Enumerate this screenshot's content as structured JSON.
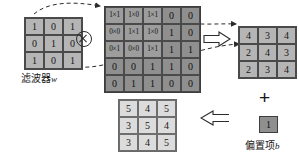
{
  "diagram": {
    "filter": {
      "label": "滤波器",
      "label_var": "w",
      "rows": [
        [
          "1",
          "0",
          "1"
        ],
        [
          "0",
          "1",
          "0"
        ],
        [
          "1",
          "0",
          "1"
        ]
      ]
    },
    "input": {
      "rows": [
        [
          "1×1",
          "1×0",
          "1×1",
          "0",
          "0"
        ],
        [
          "0×0",
          "1×1",
          "1×0",
          "1",
          "0"
        ],
        [
          "0×1",
          "0×0",
          "1×1",
          "1",
          "1"
        ],
        [
          "0",
          "0",
          "1",
          "1",
          "0"
        ],
        [
          "0",
          "1",
          "1",
          "0",
          "0"
        ]
      ],
      "overlay_cols": 3,
      "overlay_rows": 3
    },
    "result": {
      "rows": [
        [
          "4",
          "3",
          "4"
        ],
        [
          "2",
          "4",
          "3"
        ],
        [
          "2",
          "3",
          "4"
        ]
      ]
    },
    "bias": {
      "value": "1",
      "label": "偏置项",
      "label_var": "b"
    },
    "output": {
      "rows": [
        [
          "5",
          "4",
          "5"
        ],
        [
          "3",
          "5",
          "4"
        ],
        [
          "3",
          "4",
          "5"
        ]
      ]
    },
    "operators": {
      "convolution": "⊗",
      "plus": "+",
      "implies_right": "⟹",
      "implies_left": "⟸"
    },
    "colors": {
      "filter_fill": "#b5b5b5",
      "input_fill": "#8f8f8f",
      "overlay_fill": "#9d9d9d",
      "result_fill": "#b5b5b5",
      "output_fill": "#dcdcdc",
      "bias_fill": "#8f8f8f",
      "stroke": "#3d3d3d",
      "background": "#ffffff"
    }
  }
}
